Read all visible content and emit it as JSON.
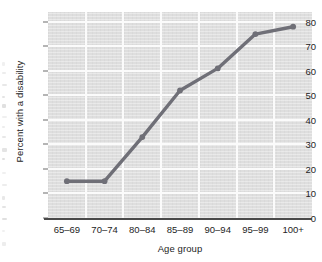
{
  "chart_data": {
    "type": "line",
    "title": "",
    "xlabel": "Age group",
    "ylabel": "Percent with a disability",
    "categories": [
      "65–69",
      "70–74",
      "80–84",
      "85–89",
      "90–94",
      "95–99",
      "100+"
    ],
    "values": [
      15,
      15,
      33,
      52,
      61,
      75,
      78
    ],
    "series": [
      {
        "name": "Percent with a disability",
        "values": [
          15,
          15,
          33,
          52,
          61,
          75,
          78
        ],
        "color": "#6f6f77",
        "marker": "circle"
      }
    ],
    "ylim": [
      0,
      84
    ],
    "yticks": [
      0,
      10,
      20,
      30,
      40,
      50,
      60,
      70,
      80
    ],
    "ytick_labels": [
      "0",
      "10",
      "20",
      "30",
      "40",
      "50",
      "60",
      "70",
      "80"
    ],
    "grid": true,
    "legend": false,
    "plot_background_color": "#dedede",
    "gridline_color": "#fbfbfb",
    "axis_color": "#4a4a4a"
  },
  "axes": {
    "x_title": "Age group",
    "y_title": "Percent with a disability"
  }
}
